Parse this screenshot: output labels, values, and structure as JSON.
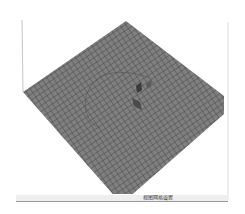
{
  "viewport": {
    "name": "3D grid view",
    "grid_color": "#7a7a7a",
    "grid_line_color": "#4e4e4e",
    "background": "#ffffff"
  },
  "statusbar": {
    "text": "视图网格设置",
    "sub_text": "mm"
  }
}
